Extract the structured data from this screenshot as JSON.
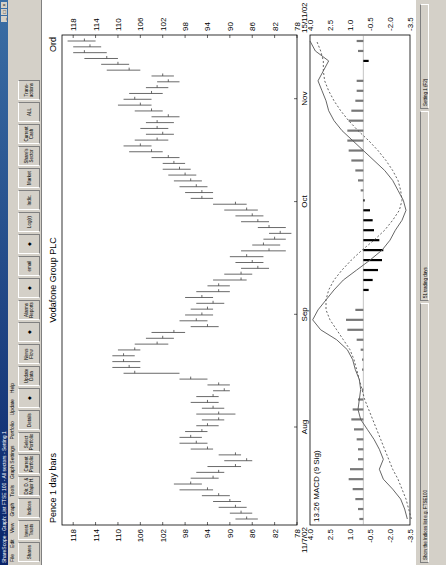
{
  "window": {
    "title": "ShareScope - Graph: List FTSE 100 - All sectors - Setting 1",
    "controls": [
      "_",
      "□",
      "×"
    ]
  },
  "menu": [
    "File",
    "Edit",
    "View",
    "Graph",
    "Tools",
    "Graph Settings",
    "Portfolio",
    "Update",
    "Help"
  ],
  "toolbar": [
    {
      "label": "Shares",
      "icon": "shares-icon"
    },
    {
      "label": "Invest. Trusts",
      "icon": "trusts-icon"
    },
    {
      "label": "Indices",
      "icon": "indices-icon"
    },
    {
      "label": "Dir. D. & Major H.",
      "icon": "directors-icon"
    },
    {
      "label": "Current Portfolio",
      "icon": "portfolio-icon"
    },
    {
      "label": "Select Portfolio",
      "icon": "select-portfolio-icon"
    },
    {
      "label": "Details",
      "icon": "details-icon"
    },
    {
      "label": "",
      "icon": "graph-icon"
    },
    {
      "label": "Update Data",
      "icon": "update-icon"
    },
    {
      "label": "News Flow",
      "icon": "news-icon"
    },
    {
      "label": "",
      "icon": "pin-icon"
    },
    {
      "label": "Alarms Reports",
      "icon": "alarms-icon"
    },
    {
      "label": "",
      "icon": "cog-icon"
    },
    {
      "label": "email",
      "icon": "email-icon"
    },
    {
      "label": "",
      "icon": "help-pointer-icon"
    },
    {
      "label": "Log(r)",
      "icon": "log-icon"
    },
    {
      "label": "Indic.",
      "icon": "indicator-icon"
    },
    {
      "label": "Market",
      "icon": "market-icon"
    },
    {
      "label": "Share's Sector",
      "icon": "sector-icon"
    },
    {
      "label": "Current Cash",
      "icon": "cash-icon"
    },
    {
      "label": "ALL",
      "icon": "all-icon"
    },
    {
      "label": "Trans-actions",
      "icon": "transactions-icon"
    }
  ],
  "tooltip": "Show indices",
  "status": {
    "left": "Show the Indices list e.g. FTSE100",
    "middle": "51 trading days",
    "right": "Setting 1 (F2)"
  },
  "chart_data": [
    {
      "type": "bar",
      "subtype": "ohlc",
      "title": "Vodafone Group PLC",
      "subtitle_left": "Pence 1 day bars",
      "subtitle_right": "Ord",
      "xlabel": "",
      "ylabel": "Pence",
      "ylim": [
        78,
        120
      ],
      "y_ticks": [
        118,
        114,
        110,
        106,
        102,
        98,
        94,
        90,
        86,
        82,
        78
      ],
      "x_start": "11/7/02",
      "x_end": "15/11/02",
      "x_ticks": [
        "Aug",
        "Sep",
        "Oct",
        "Nov"
      ],
      "grid": false,
      "values_note": "approximate readings: [high, low, close] per bar",
      "bars": [
        [
          89,
          85,
          87
        ],
        [
          90,
          86,
          88
        ],
        [
          92,
          87,
          89
        ],
        [
          93,
          88,
          90
        ],
        [
          95,
          90,
          92
        ],
        [
          99,
          93,
          94
        ],
        [
          100,
          95,
          97
        ],
        [
          97,
          92,
          93
        ],
        [
          96,
          91,
          92
        ],
        [
          94,
          88,
          89
        ],
        [
          91,
          86,
          87
        ],
        [
          92,
          88,
          89
        ],
        [
          97,
          93,
          94
        ],
        [
          99,
          94,
          96
        ],
        [
          99,
          95,
          97
        ],
        [
          98,
          94,
          95
        ],
        [
          96,
          92,
          94
        ],
        [
          95,
          91,
          92
        ],
        [
          96,
          89,
          92
        ],
        [
          95,
          91,
          93
        ],
        [
          97,
          92,
          94
        ],
        [
          96,
          92,
          93
        ],
        [
          93,
          90,
          91
        ],
        [
          94,
          90,
          92
        ],
        [
          99,
          94,
          97
        ],
        [
          109,
          99,
          107
        ],
        [
          111,
          106,
          108
        ],
        [
          111,
          106,
          109
        ],
        [
          111,
          107,
          109
        ],
        [
          110,
          106,
          107
        ],
        [
          107,
          101,
          103
        ],
        [
          105,
          100,
          102
        ],
        [
          104,
          98,
          100
        ],
        [
          97,
          92,
          94
        ],
        [
          99,
          94,
          96
        ],
        [
          98,
          93,
          95
        ],
        [
          97,
          93,
          94
        ],
        [
          96,
          91,
          93
        ],
        [
          98,
          93,
          95
        ],
        [
          96,
          90,
          92
        ],
        [
          94,
          90,
          92
        ],
        [
          93,
          87,
          88
        ],
        [
          91,
          86,
          88
        ],
        [
          88,
          83,
          85
        ],
        [
          89,
          84,
          86
        ],
        [
          90,
          84,
          87
        ],
        [
          88,
          80,
          83
        ],
        [
          86,
          81,
          84
        ],
        [
          84,
          80,
          82
        ],
        [
          83,
          79,
          81
        ],
        [
          85,
          80,
          83
        ],
        [
          88,
          83,
          85
        ],
        [
          89,
          84,
          86
        ],
        [
          91,
          85,
          87
        ],
        [
          93,
          87,
          89
        ],
        [
          97,
          93,
          95
        ],
        [
          98,
          93,
          95
        ],
        [
          99,
          94,
          96
        ],
        [
          100,
          95,
          97
        ],
        [
          101,
          96,
          98
        ],
        [
          102,
          97,
          99
        ],
        [
          102,
          98,
          100
        ],
        [
          104,
          99,
          101
        ],
        [
          108,
          102,
          104
        ],
        [
          109,
          104,
          106
        ],
        [
          107,
          101,
          103
        ],
        [
          105,
          100,
          102
        ],
        [
          106,
          101,
          103
        ],
        [
          105,
          100,
          103
        ],
        [
          104,
          99,
          101
        ],
        [
          107,
          102,
          104
        ],
        [
          110,
          104,
          106
        ],
        [
          109,
          104,
          107
        ],
        [
          108,
          102,
          104
        ],
        [
          105,
          101,
          103
        ],
        [
          103,
          99,
          101
        ],
        [
          104,
          100,
          102
        ],
        [
          112,
          106,
          108
        ],
        [
          113,
          108,
          110
        ],
        [
          116,
          110,
          112
        ],
        [
          118,
          112,
          116
        ],
        [
          118,
          113,
          115
        ],
        [
          119,
          114,
          116
        ]
      ]
    },
    {
      "type": "line",
      "title": "13.26 MACD (9 Sig)",
      "ylim": [
        -3.5,
        4.0
      ],
      "y_ticks": [
        4.0,
        2.5,
        1.0,
        -0.5,
        -2.0,
        -3.5
      ],
      "zero_line": 0,
      "x_ticks": [
        "Aug",
        "Sep",
        "Oct",
        "Nov"
      ],
      "series": [
        {
          "name": "MACD",
          "style": "solid",
          "values": [
            -3.3,
            -3.1,
            -2.8,
            -2.2,
            -1.5,
            -1.2,
            -1.5,
            -1.2,
            -0.8,
            -0.3,
            0.2,
            0.4,
            0.3,
            0.2,
            0.3,
            0.6,
            0.8,
            1.2,
            2.0,
            3.2,
            3.8,
            3.4,
            2.8,
            2.2,
            1.5,
            0.5,
            -0.5,
            -1.4,
            -2.0,
            -2.4,
            -2.9,
            -3.2,
            -3.0,
            -2.6,
            -2.2,
            -1.6,
            -0.8,
            0.0,
            0.8,
            1.6,
            2.2,
            2.6,
            2.8,
            3.1,
            3.4,
            3.0,
            2.6,
            3.6,
            4.0
          ]
        },
        {
          "name": "Signal (9)",
          "style": "dotted",
          "values": [
            -3.6,
            -3.4,
            -3.2,
            -2.9,
            -2.6,
            -2.2,
            -1.9,
            -1.6,
            -1.3,
            -1.0,
            -0.7,
            -0.4,
            -0.1,
            0.1,
            0.3,
            0.5,
            0.7,
            1.0,
            1.5,
            2.0,
            2.5,
            2.8,
            2.8,
            2.6,
            2.2,
            1.6,
            0.9,
            0.1,
            -0.8,
            -1.6,
            -2.2,
            -2.7,
            -2.9,
            -2.8,
            -2.6,
            -2.2,
            -1.7,
            -1.1,
            -0.4,
            0.4,
            1.1,
            1.7,
            2.2,
            2.6,
            2.9,
            3.0,
            3.0,
            3.2,
            3.5
          ]
        },
        {
          "name": "Histogram",
          "style": "bars",
          "values": [
            0.3,
            0.4,
            0.6,
            0.8,
            1.1,
            1.0,
            0.4,
            0.4,
            0.5,
            0.7,
            0.9,
            0.8,
            0.4,
            0.1,
            0.0,
            0.1,
            0.1,
            0.2,
            0.5,
            1.2,
            1.3,
            0.6,
            0.0,
            -0.4,
            -0.7,
            -1.1,
            -1.4,
            -1.5,
            -1.2,
            -0.8,
            -0.7,
            -0.5,
            -0.1,
            0.2,
            0.4,
            0.6,
            0.9,
            1.1,
            1.2,
            1.2,
            1.1,
            0.9,
            0.6,
            0.5,
            0.5,
            0.0,
            -0.4,
            0.4,
            0.5
          ]
        }
      ]
    }
  ]
}
